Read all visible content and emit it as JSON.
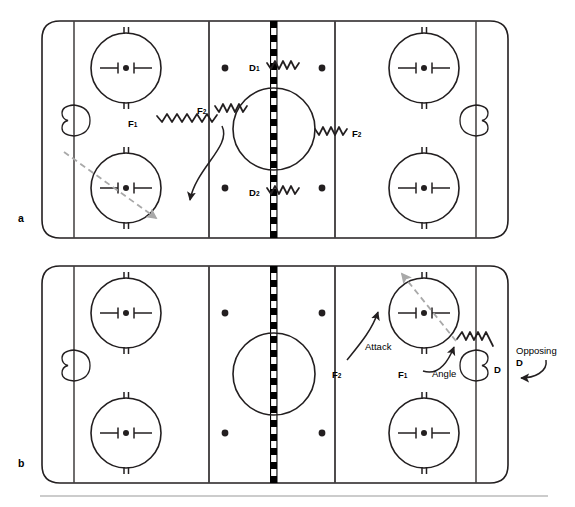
{
  "figure": {
    "type": "hockey-rink-tactic-diagram",
    "panel_count": 2,
    "colors": {
      "ink": "#231f20",
      "dashed_path": "#a9a9a9",
      "center_line": "#000000",
      "background": "#ffffff",
      "footer_rule": "#9a9a9a"
    }
  },
  "panels": [
    {
      "id": "a",
      "label": "a",
      "labels": [
        {
          "name": "f1",
          "text": "F",
          "sub": "1"
        },
        {
          "name": "f2-left",
          "text": "F",
          "sub": "2"
        },
        {
          "name": "f2-right",
          "text": "F",
          "sub": "2"
        },
        {
          "name": "d1",
          "text": "D",
          "sub": "1"
        },
        {
          "name": "d2",
          "text": "D",
          "sub": "2"
        }
      ]
    },
    {
      "id": "b",
      "label": "b",
      "labels": [
        {
          "name": "f2",
          "text": "F",
          "sub": "2"
        },
        {
          "name": "f1",
          "text": "F",
          "sub": "1"
        },
        {
          "name": "d",
          "text": "D",
          "sub": ""
        },
        {
          "name": "attack",
          "text": "Attack",
          "sub": ""
        },
        {
          "name": "angle",
          "text": "Angle",
          "sub": ""
        },
        {
          "name": "opposing",
          "text": "Opposing",
          "sub": ""
        },
        {
          "name": "opposing-d",
          "text": "D",
          "sub": ""
        }
      ]
    }
  ],
  "rink": {
    "zones": [
      "defensive-zone",
      "neutral-zone",
      "offensive-zone"
    ],
    "features": [
      "rounded-boards",
      "goal-lines",
      "blue-lines",
      "center-line-dashed",
      "center-faceoff-circle",
      "end-zone-faceoff-circles",
      "neutral-zone-faceoff-dots",
      "goal-creases"
    ],
    "faceoff_circle_count": 4,
    "neutral_dot_count": 4
  }
}
